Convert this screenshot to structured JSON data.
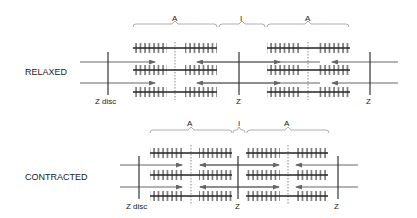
{
  "relaxed": {
    "state_label": "RELAXED",
    "z_disc_label": "Z disc",
    "z_label": "Z",
    "band_labels": {
      "a_left": "A",
      "i": "I",
      "a_right": "A"
    }
  },
  "contracted": {
    "state_label": "CONTRACTED",
    "z_disc_label": "Z disc",
    "z_label": "Z",
    "band_labels": {
      "a_left": "A",
      "i": "I",
      "a_right": "A"
    }
  },
  "colors": {
    "line": "#333333",
    "arrow": "#666666",
    "brace": "#999999"
  }
}
